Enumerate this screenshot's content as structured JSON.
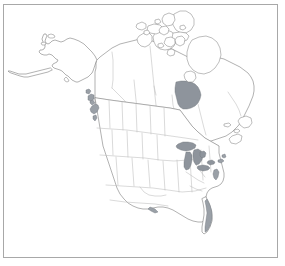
{
  "figure": {
    "width_px": 285,
    "height_px": 266,
    "background_color": "#ffffff",
    "frame": {
      "border_color": "#a8a8a8",
      "border_width_px": 1,
      "left_px": 3,
      "top_px": 4,
      "width_px": 275,
      "height_px": 254
    },
    "styles": {
      "coastline_color": "#7d7d7d",
      "admin_boundary_color": "#bcbcbc",
      "water_fill_color": "#8e949c",
      "shaded_coast_color": "#9aa0a7",
      "land_fill_color": "#ffffff"
    }
  },
  "map": {
    "name": "north-america",
    "projection_hint": "conic",
    "regions": [
      {
        "name": "alaska",
        "label": "Alaska"
      },
      {
        "name": "canada-mainland",
        "label": "Canada"
      },
      {
        "name": "canadian-arctic-archipelago",
        "label": "Canadian Arctic Archipelago"
      },
      {
        "name": "conterminous-united-states",
        "label": "United States"
      }
    ],
    "water_bodies": [
      {
        "name": "lake-superior",
        "label": "Lake Superior"
      },
      {
        "name": "lake-michigan",
        "label": "Lake Michigan"
      },
      {
        "name": "lake-huron",
        "label": "Lake Huron"
      },
      {
        "name": "lake-erie",
        "label": "Lake Erie"
      },
      {
        "name": "lake-ontario",
        "label": "Lake Ontario"
      },
      {
        "name": "hudson-bay",
        "label": "Hudson Bay"
      },
      {
        "name": "gulf-of-mexico",
        "label": "Gulf of Mexico"
      }
    ],
    "shaded_features": [
      {
        "name": "pacific-northwest-islands",
        "label": "Pacific Northwest coastal islands"
      },
      {
        "name": "florida-coast",
        "label": "Florida coastal shading"
      },
      {
        "name": "chesapeake-bay",
        "label": "Chesapeake Bay"
      }
    ],
    "boundaries_shown": {
      "us_state_borders": true,
      "canadian_province_borders": true,
      "international_borders": true,
      "graticule": false,
      "labels": false,
      "legend": false
    }
  }
}
